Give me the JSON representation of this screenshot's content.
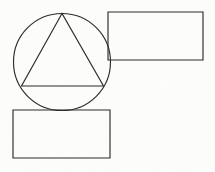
{
  "figure": {
    "title": "Overlapping geometric shapes line drawing",
    "background_color": "#fdfdfc",
    "stroke_color": "#2b2b2b",
    "stroke_width": 1.15,
    "canvas": {
      "width": 215,
      "height": 172
    },
    "shapes": [
      {
        "id": "circle",
        "name": "circle",
        "type": "circle",
        "cx": 62,
        "cy": 62,
        "r": 48.5,
        "label": "Circle"
      },
      {
        "id": "triangle",
        "name": "inscribed-triangle",
        "type": "polygon",
        "points": "62,13.5 21.5,86 103.5,86",
        "vertices": [
          {
            "x": 62,
            "y": 13.5,
            "label": "apex"
          },
          {
            "x": 21.5,
            "y": 86,
            "label": "bottom-left"
          },
          {
            "x": 103.5,
            "y": 86,
            "label": "bottom-right"
          }
        ],
        "label": "Triangle inscribed in circle"
      },
      {
        "id": "rect-top-right",
        "name": "top-right-rectangle",
        "type": "rect",
        "x": 108,
        "y": 12,
        "width": 95,
        "height": 48,
        "label": "Upper right rectangle"
      },
      {
        "id": "rect-bottom-left",
        "name": "bottom-left-rectangle",
        "type": "rect",
        "x": 13,
        "y": 110,
        "width": 97,
        "height": 48,
        "label": "Lower left rectangle"
      }
    ]
  }
}
